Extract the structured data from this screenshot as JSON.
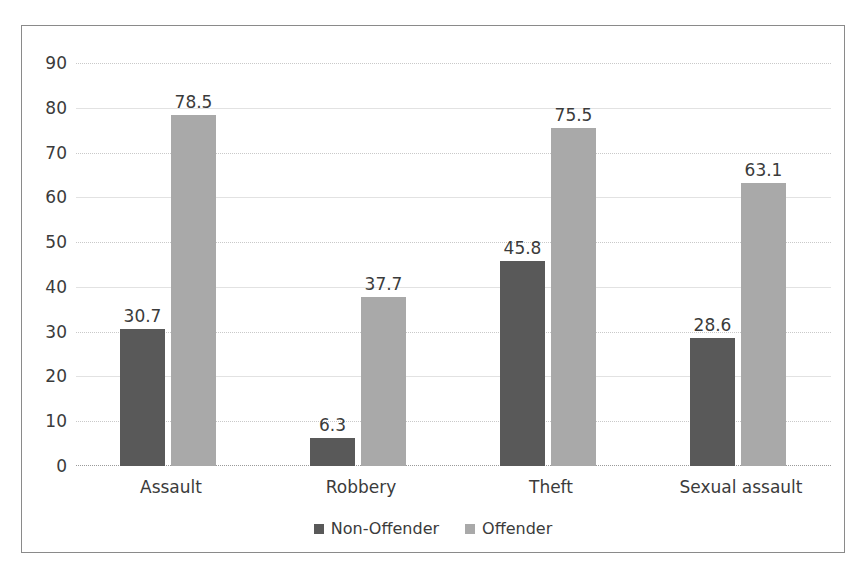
{
  "chart_data": {
    "type": "bar",
    "title": "",
    "subtitle": "",
    "xlabel": "",
    "ylabel": "",
    "categories": [
      "Assault",
      "Robbery",
      "Theft",
      "Sexual assault"
    ],
    "series": [
      {
        "name": "Non-Offender",
        "color": "#595959",
        "values": [
          30.7,
          6.3,
          45.8,
          28.6
        ]
      },
      {
        "name": "Offender",
        "color": "#a9a9a9",
        "values": [
          78.5,
          37.7,
          75.5,
          63.1
        ]
      }
    ],
    "data_labels": [
      [
        "30.7",
        "6.3",
        "45.8",
        "28.6"
      ],
      [
        "78.5",
        "37.7",
        "75.5",
        "63.1"
      ]
    ],
    "ylim": [
      0,
      90
    ],
    "ytick_values": [
      0,
      10,
      20,
      30,
      40,
      50,
      60,
      70,
      80,
      90
    ],
    "ytick_labels": [
      "0",
      "10",
      "20",
      "30",
      "40",
      "50",
      "60",
      "70",
      "80",
      "90"
    ],
    "grid": true,
    "legend_position": "bottom"
  },
  "legend": {
    "entries": [
      {
        "label": "Non-Offender"
      },
      {
        "label": "Offender"
      }
    ]
  }
}
